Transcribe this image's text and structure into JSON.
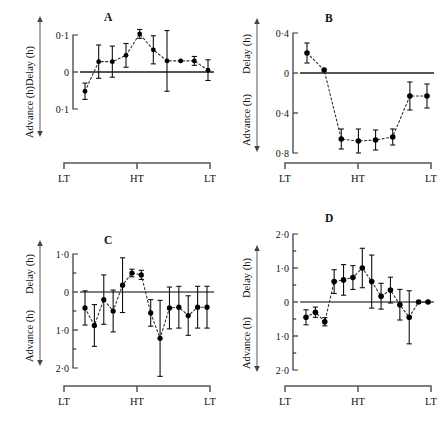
{
  "figure": {
    "panel_count": 4,
    "axis_label_delay": "Delay (h)",
    "axis_label_advance": "Advance (h)",
    "x_tick_labels": [
      "LT",
      "HT",
      "LT"
    ],
    "marker_color": "#000000",
    "line_color": "#222222",
    "axis_color": "#555555"
  },
  "chart_data": [
    {
      "type": "scatter",
      "title": "A",
      "panel": "A",
      "xlabel": "",
      "ylabel": "Delay (h) / Advance (h)",
      "ylim": [
        -0.15,
        0.15
      ],
      "yticks": [
        0.1,
        0,
        -0.1
      ],
      "ytick_labels": [
        "0·1",
        "0",
        "0·1"
      ],
      "xticks": [
        "LT",
        "HT",
        "LT"
      ],
      "grid": false,
      "legend": "none",
      "zero_line": true,
      "connector": "dotted",
      "x": [
        1,
        2,
        3,
        4,
        5,
        6,
        7,
        8,
        9,
        10
      ],
      "y": [
        -0.052,
        0.028,
        0.028,
        0.045,
        0.103,
        0.06,
        0.03,
        0.03,
        0.03,
        0.005
      ],
      "yerr": [
        0.022,
        0.045,
        0.042,
        0.032,
        0.012,
        0.038,
        0.082,
        0.0,
        0.012,
        0.028
      ]
    },
    {
      "type": "scatter",
      "title": "B",
      "panel": "B",
      "xlabel": "",
      "ylabel": "Delay (h) / Advance (h)",
      "ylim": [
        -0.92,
        0.52
      ],
      "yticks": [
        0.4,
        0,
        -0.4,
        -0.8
      ],
      "ytick_labels": [
        "0·4",
        "0",
        "0·4",
        "0·8"
      ],
      "xticks": [
        "LT",
        "HT",
        "LT"
      ],
      "grid": false,
      "legend": "none",
      "zero_line": true,
      "connector": "dotted",
      "x": [
        1,
        2,
        3,
        4,
        5,
        6,
        7,
        8
      ],
      "y": [
        0.2,
        0.03,
        -0.66,
        -0.68,
        -0.67,
        -0.64,
        -0.23,
        -0.23
      ],
      "yerr": [
        0.1,
        0.0,
        0.1,
        0.12,
        0.1,
        0.08,
        0.14,
        0.12
      ]
    },
    {
      "type": "scatter",
      "title": "C",
      "panel": "C",
      "xlabel": "",
      "ylabel": "Delay (h) / Advance (h)",
      "ylim": [
        -2.25,
        1.25
      ],
      "yticks": [
        1.0,
        0,
        -1.0,
        -2.0
      ],
      "ytick_labels": [
        "1·0",
        "0",
        "1·0",
        "2·0"
      ],
      "minor_yticks": [
        0.5,
        -0.5,
        -1.5
      ],
      "xticks": [
        "LT",
        "HT",
        "LT"
      ],
      "grid": false,
      "legend": "none",
      "zero_line": true,
      "connector": "dotted",
      "x": [
        1,
        2,
        3,
        4,
        5,
        6,
        7,
        8,
        9,
        10,
        11,
        12,
        13,
        14
      ],
      "y": [
        -0.42,
        -0.88,
        -0.2,
        -0.5,
        0.18,
        0.5,
        0.45,
        -0.55,
        -1.22,
        -0.42,
        -0.4,
        -0.62,
        -0.4,
        -0.4
      ],
      "yerr": [
        0.45,
        0.55,
        0.65,
        0.55,
        0.72,
        0.1,
        0.12,
        0.35,
        1.0,
        0.55,
        0.55,
        0.52,
        0.55,
        0.55
      ]
    },
    {
      "type": "scatter",
      "title": "D",
      "panel": "D",
      "xlabel": "",
      "ylabel": "Delay (h) / Advance (h)",
      "ylim": [
        -2.25,
        2.25
      ],
      "yticks": [
        2.0,
        1.0,
        0,
        -1.0,
        -2.0
      ],
      "ytick_labels": [
        "2·0",
        "1·0",
        "0",
        "1·0",
        "2·0"
      ],
      "minor_yticks": [
        1.5,
        0.5,
        -0.5,
        -1.5
      ],
      "xticks": [
        "LT",
        "HT",
        "LT"
      ],
      "grid": false,
      "legend": "none",
      "zero_line": true,
      "connector": "dotted",
      "x": [
        1,
        2,
        3,
        4,
        5,
        6,
        7,
        8,
        9,
        10,
        11,
        12,
        13,
        14
      ],
      "y": [
        -0.45,
        -0.3,
        -0.58,
        0.6,
        0.65,
        0.72,
        1.0,
        0.6,
        0.17,
        0.35,
        -0.08,
        -0.45,
        0.0,
        0.0
      ],
      "yerr": [
        0.22,
        0.15,
        0.12,
        0.35,
        0.45,
        0.35,
        0.58,
        0.78,
        0.38,
        0.38,
        0.45,
        0.78,
        0.0,
        0.0
      ]
    }
  ],
  "panels": {
    "A": {
      "label": "A"
    },
    "B": {
      "label": "B"
    },
    "C": {
      "label": "C"
    },
    "D": {
      "label": "D"
    }
  }
}
